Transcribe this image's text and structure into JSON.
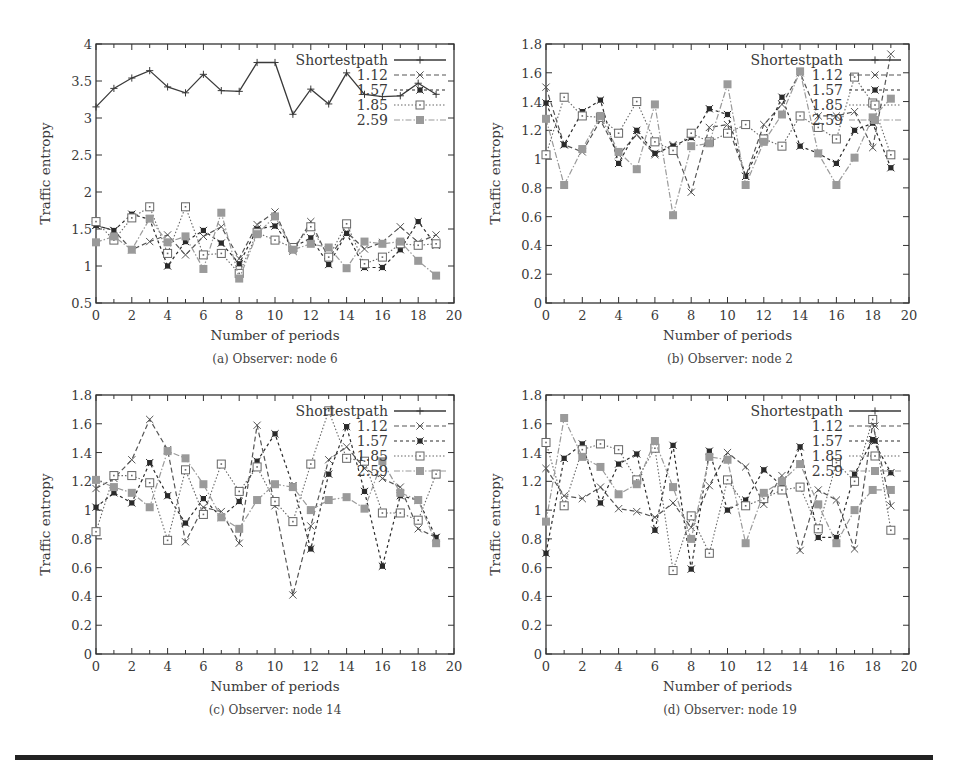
{
  "chart_data": [
    {
      "type": "line",
      "panel": "a",
      "caption": "(a) Observer: node 6",
      "title": "",
      "xlabel": "Number of periods",
      "ylabel": "Traffic entropy",
      "xlim": [
        0,
        20
      ],
      "ylim": [
        0.5,
        4
      ],
      "xticks": [
        0,
        2,
        4,
        6,
        8,
        10,
        12,
        14,
        16,
        18,
        20
      ],
      "yticks": [
        0.5,
        1,
        1.5,
        2,
        2.5,
        3,
        3.5,
        4
      ],
      "ytick_labels": [
        "0.5",
        "1",
        "1.5",
        "2",
        "2.5",
        "3",
        "3.5",
        "4"
      ],
      "grid": false,
      "legend_position": "upper right",
      "x": [
        0,
        1,
        2,
        3,
        4,
        5,
        6,
        7,
        8,
        9,
        10,
        11,
        12,
        13,
        14,
        15,
        16,
        17,
        18,
        19
      ],
      "series": [
        {
          "name": "Shortestpath",
          "values": [
            3.15,
            3.4,
            3.54,
            3.64,
            3.42,
            3.34,
            3.59,
            3.37,
            3.36,
            3.75,
            3.75,
            3.05,
            3.39,
            3.19,
            3.61,
            3.32,
            3.29,
            3.3,
            3.47,
            3.32
          ]
        },
        {
          "name": "1.12",
          "values": [
            1.55,
            1.48,
            1.22,
            1.33,
            1.42,
            1.15,
            1.4,
            1.53,
            1.1,
            1.56,
            1.73,
            1.2,
            1.6,
            1.1,
            1.46,
            1.23,
            1.32,
            1.53,
            1.32,
            1.42
          ]
        },
        {
          "name": "1.57",
          "values": [
            1.55,
            1.48,
            1.7,
            1.63,
            1.0,
            1.33,
            1.48,
            1.31,
            1.03,
            1.5,
            1.54,
            1.25,
            1.38,
            1.02,
            1.44,
            0.98,
            0.98,
            1.22,
            1.6,
            1.28
          ]
        },
        {
          "name": "1.85",
          "values": [
            1.6,
            1.35,
            1.65,
            1.8,
            1.17,
            1.8,
            1.15,
            1.17,
            0.9,
            1.45,
            1.35,
            1.25,
            1.53,
            1.12,
            1.57,
            1.03,
            1.12,
            1.3,
            1.28,
            1.3
          ]
        },
        {
          "name": "2.59",
          "values": [
            1.32,
            1.4,
            1.22,
            1.64,
            1.32,
            1.4,
            0.96,
            1.72,
            0.83,
            1.43,
            1.67,
            1.22,
            1.3,
            1.25,
            0.97,
            1.33,
            1.3,
            1.33,
            1.07,
            0.87
          ]
        }
      ]
    },
    {
      "type": "line",
      "panel": "b",
      "caption": "(b) Observer: node 2",
      "title": "",
      "xlabel": "Number of periods",
      "ylabel": "Traffic entropy",
      "xlim": [
        0,
        20
      ],
      "ylim": [
        0,
        1.8
      ],
      "xticks": [
        0,
        2,
        4,
        6,
        8,
        10,
        12,
        14,
        16,
        18,
        20
      ],
      "yticks": [
        0,
        0.2,
        0.4,
        0.6,
        0.8,
        1,
        1.2,
        1.4,
        1.6,
        1.8
      ],
      "ytick_labels": [
        "0",
        "0.2",
        "0.4",
        "0.6",
        "0.8",
        "1",
        "1.2",
        "1.4",
        "1.6",
        "1.8"
      ],
      "grid": false,
      "legend_position": "upper right",
      "x": [
        0,
        1,
        2,
        3,
        4,
        5,
        6,
        7,
        8,
        9,
        10,
        11,
        12,
        13,
        14,
        15,
        16,
        17,
        18,
        19
      ],
      "series": [
        {
          "name": "Shortestpath",
          "values": []
        },
        {
          "name": "1.12",
          "values": [
            1.5,
            1.1,
            1.05,
            1.27,
            1.03,
            1.17,
            1.03,
            1.1,
            0.77,
            1.22,
            1.24,
            0.88,
            1.24,
            1.38,
            1.6,
            1.3,
            1.3,
            1.33,
            1.08,
            1.73
          ]
        },
        {
          "name": "1.57",
          "values": [
            1.39,
            1.1,
            1.33,
            1.41,
            0.97,
            1.2,
            1.04,
            1.09,
            1.15,
            1.35,
            1.31,
            0.88,
            1.15,
            1.43,
            1.09,
            1.04,
            0.97,
            1.2,
            1.25,
            0.94
          ]
        },
        {
          "name": "1.85",
          "values": [
            1.03,
            1.43,
            1.3,
            1.29,
            1.18,
            1.4,
            1.12,
            1.06,
            1.18,
            1.12,
            1.18,
            1.24,
            1.14,
            1.09,
            1.3,
            1.22,
            1.14,
            1.57,
            1.39,
            1.03
          ]
        },
        {
          "name": "2.59",
          "values": [
            1.28,
            0.82,
            1.07,
            1.3,
            1.05,
            0.93,
            1.38,
            0.61,
            1.09,
            1.11,
            1.52,
            0.82,
            1.12,
            1.31,
            1.61,
            1.04,
            0.82,
            1.01,
            1.29,
            1.42
          ]
        }
      ]
    },
    {
      "type": "line",
      "panel": "c",
      "caption": "(c) Observer: node 14",
      "title": "",
      "xlabel": "Number of periods",
      "ylabel": "Traffic entropy",
      "xlim": [
        0,
        20
      ],
      "ylim": [
        0,
        1.8
      ],
      "xticks": [
        0,
        2,
        4,
        6,
        8,
        10,
        12,
        14,
        16,
        18,
        20
      ],
      "yticks": [
        0,
        0.2,
        0.4,
        0.6,
        0.8,
        1,
        1.2,
        1.4,
        1.6,
        1.8
      ],
      "ytick_labels": [
        "0",
        "0.2",
        "0.4",
        "0.6",
        "0.8",
        "1",
        "1.2",
        "1.4",
        "1.6",
        "1.8"
      ],
      "grid": false,
      "legend_position": "upper right",
      "x": [
        0,
        1,
        2,
        3,
        4,
        5,
        6,
        7,
        8,
        9,
        10,
        11,
        12,
        13,
        14,
        15,
        16,
        17,
        18,
        19
      ],
      "series": [
        {
          "name": "Shortestpath",
          "values": []
        },
        {
          "name": "1.12",
          "values": [
            1.15,
            1.22,
            1.35,
            1.63,
            1.42,
            0.78,
            1.02,
            0.99,
            0.77,
            1.59,
            1.03,
            0.41,
            0.89,
            1.35,
            1.44,
            1.29,
            1.22,
            1.16,
            0.87,
            0.81
          ]
        },
        {
          "name": "1.57",
          "values": [
            1.02,
            1.12,
            1.05,
            1.33,
            1.1,
            0.91,
            1.08,
            0.95,
            1.06,
            1.34,
            1.53,
            1.17,
            0.73,
            1.25,
            1.58,
            1.13,
            0.61,
            1.1,
            1.07,
            0.81
          ]
        },
        {
          "name": "1.85",
          "values": [
            0.85,
            1.24,
            1.24,
            1.19,
            0.79,
            1.28,
            0.97,
            1.32,
            1.13,
            1.3,
            1.06,
            0.92,
            1.32,
            1.69,
            1.36,
            1.34,
            0.98,
            0.98,
            0.93,
            1.25
          ]
        },
        {
          "name": "2.59",
          "values": [
            1.21,
            1.16,
            1.12,
            1.02,
            1.41,
            1.36,
            1.18,
            0.95,
            0.87,
            1.07,
            1.18,
            1.16,
            1.0,
            1.07,
            1.09,
            1.01,
            1.34,
            1.12,
            1.07,
            0.77
          ]
        }
      ]
    },
    {
      "type": "line",
      "panel": "d",
      "caption": "(d) Observer: node 19",
      "title": "",
      "xlabel": "Number of periods",
      "ylabel": "Traffic entropy",
      "xlim": [
        0,
        20
      ],
      "ylim": [
        0,
        1.8
      ],
      "xticks": [
        0,
        2,
        4,
        6,
        8,
        10,
        12,
        14,
        16,
        18,
        20
      ],
      "yticks": [
        0,
        0.2,
        0.4,
        0.6,
        0.8,
        1,
        1.2,
        1.4,
        1.6,
        1.8
      ],
      "ytick_labels": [
        "0",
        "0.2",
        "0.4",
        "0.6",
        "0.8",
        "1",
        "1.2",
        "1.4",
        "1.6",
        "1.8"
      ],
      "grid": false,
      "legend_position": "upper right",
      "x": [
        0,
        1,
        2,
        3,
        4,
        5,
        6,
        7,
        8,
        9,
        10,
        11,
        12,
        13,
        14,
        15,
        16,
        17,
        18,
        19
      ],
      "series": [
        {
          "name": "Shortestpath",
          "values": []
        },
        {
          "name": "1.12",
          "values": [
            1.29,
            1.1,
            1.08,
            1.16,
            1.01,
            0.99,
            0.95,
            1.05,
            0.88,
            1.17,
            1.4,
            1.3,
            1.04,
            1.24,
            0.72,
            1.14,
            1.07,
            0.73,
            1.6,
            1.03
          ]
        },
        {
          "name": "1.57",
          "values": [
            0.7,
            1.36,
            1.46,
            1.05,
            1.32,
            1.39,
            0.86,
            1.45,
            0.59,
            1.41,
            1.0,
            1.07,
            1.28,
            1.17,
            1.44,
            0.81,
            0.81,
            1.25,
            1.49,
            1.26
          ]
        },
        {
          "name": "1.85",
          "values": [
            1.47,
            1.03,
            1.42,
            1.46,
            1.42,
            1.21,
            1.43,
            0.58,
            0.96,
            0.7,
            1.21,
            1.03,
            1.08,
            1.14,
            1.16,
            0.87,
            1.33,
            1.2,
            1.63,
            0.86
          ]
        },
        {
          "name": "2.59",
          "values": [
            0.92,
            1.64,
            1.37,
            1.3,
            1.11,
            1.18,
            1.48,
            1.16,
            0.8,
            1.37,
            1.35,
            0.77,
            1.12,
            1.2,
            1.32,
            1.04,
            0.77,
            1.0,
            1.14,
            1.14
          ]
        }
      ]
    }
  ],
  "labels": {
    "xlabel": "Number of periods",
    "ylabel": "Traffic entropy",
    "legend": [
      "Shortestpath",
      "1.12",
      "1.57",
      "1.85",
      "2.59"
    ],
    "captions": [
      "(a) Observer: node 6",
      "(b) Observer: node 2",
      "(c) Observer: node 14",
      "(d) Observer: node 19"
    ]
  },
  "colors": {
    "axis": "#333333",
    "shortestpath": "#3a3a3a",
    "s112": "#555555",
    "s157": "#2a2a2a",
    "s185": "#666666",
    "s259": "#9a9a9a",
    "rule": "#222222"
  }
}
